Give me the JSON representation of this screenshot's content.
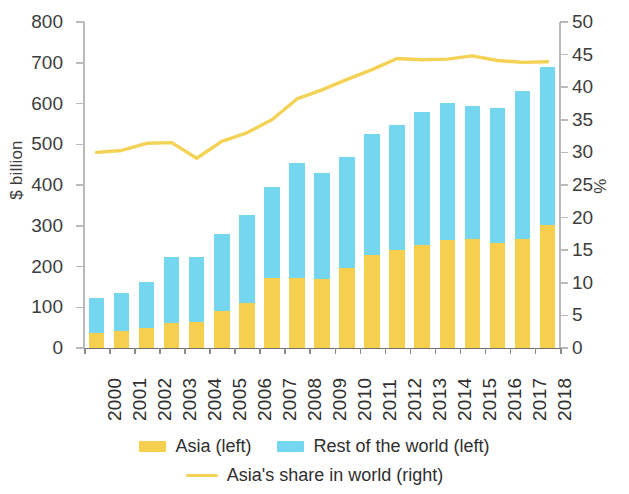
{
  "chart_data": {
    "type": "bar",
    "subtype": "stacked-bar-with-line",
    "title": "",
    "xlabel": "",
    "ylabel": "$ billion",
    "y2label": "%",
    "ylim": [
      0,
      800
    ],
    "y2lim": [
      0,
      50
    ],
    "yticks": [
      0,
      100,
      200,
      300,
      400,
      500,
      600,
      700,
      800
    ],
    "y2ticks": [
      0,
      5,
      10,
      15,
      20,
      25,
      30,
      35,
      40,
      45,
      50
    ],
    "grid": false,
    "legend_position": "bottom",
    "categories": [
      "2000",
      "2001",
      "2002",
      "2003",
      "2004",
      "2005",
      "2006",
      "2007",
      "2008",
      "2009",
      "2010",
      "2011",
      "2012",
      "2013",
      "2014",
      "2015",
      "2016",
      "2017",
      "2018"
    ],
    "series": [
      {
        "name": "Asia (left)",
        "axis": "left",
        "type": "bar",
        "color": "#F6CF4E",
        "values": [
          37,
          41,
          49,
          61,
          65,
          91,
          110,
          173,
          172,
          170,
          196,
          229,
          240,
          252,
          266,
          267,
          258,
          268,
          303
        ]
      },
      {
        "name": "Rest of the world (left)",
        "axis": "left",
        "type": "bar",
        "color": "#74D7EF",
        "values": [
          85,
          93,
          112,
          162,
          158,
          189,
          216,
          222,
          283,
          259,
          273,
          296,
          308,
          328,
          336,
          327,
          331,
          362,
          386
        ]
      },
      {
        "name": "Asia's share in world (right)",
        "axis": "right",
        "type": "line",
        "color": "#F3D255",
        "values": [
          30.0,
          30.3,
          31.4,
          31.5,
          29.1,
          31.7,
          33.0,
          35.0,
          38.2,
          39.6,
          41.2,
          42.7,
          44.4,
          44.2,
          44.3,
          44.8,
          44.1,
          43.8,
          43.9
        ]
      }
    ],
    "totals": [
      122,
      134,
      161,
      223,
      223,
      280,
      326,
      395,
      455,
      429,
      469,
      525,
      548,
      580,
      602,
      594,
      589,
      630,
      689
    ]
  },
  "axes": {
    "left_title": "$ billion",
    "right_title": "%",
    "left_tick_labels": [
      "0",
      "100",
      "200",
      "300",
      "400",
      "500",
      "600",
      "700",
      "800"
    ],
    "right_tick_labels": [
      "0",
      "5",
      "10",
      "15",
      "20",
      "25",
      "30",
      "35",
      "40",
      "45",
      "50"
    ],
    "x_tick_labels": [
      "2000",
      "2001",
      "2002",
      "2003",
      "2004",
      "2005",
      "2006",
      "2007",
      "2008",
      "2009",
      "2010",
      "2011",
      "2012",
      "2013",
      "2014",
      "2015",
      "2016",
      "2017",
      "2018"
    ]
  },
  "legend": {
    "items": [
      {
        "label": "Asia (left)",
        "color": "#F6CF4E",
        "marker": "bar"
      },
      {
        "label": "Rest of the world (left)",
        "color": "#74D7EF",
        "marker": "bar"
      },
      {
        "label": "Asia's share in world (right)",
        "color": "#F3D255",
        "marker": "line"
      }
    ]
  },
  "colors": {
    "asia": "#F6CF4E",
    "rest_of_world": "#74D7EF",
    "share_line": "#F3D255",
    "axis": "#6f6f6f",
    "text": "#2f2f2f"
  }
}
